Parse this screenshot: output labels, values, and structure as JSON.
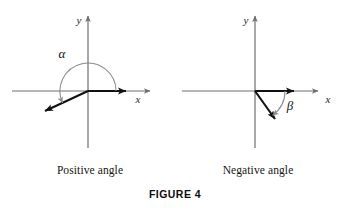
{
  "figure": {
    "label": "FIGURE 4",
    "panels": [
      {
        "id": "positive",
        "caption": "Positive angle",
        "angle_symbol": "α",
        "x_axis_label": "x",
        "y_axis_label": "y",
        "direction": "counterclockwise",
        "terminal_angle_deg": 205,
        "initial_side_angle_deg": 0,
        "arc_radius": 28
      },
      {
        "id": "negative",
        "caption": "Negative angle",
        "angle_symbol": "β",
        "x_axis_label": "x",
        "y_axis_label": "y",
        "direction": "clockwise",
        "terminal_angle_deg": -54,
        "initial_side_angle_deg": 0,
        "arc_radius": 30
      }
    ]
  },
  "colors": {
    "axis": "#6e6e6e",
    "ray": "#111111",
    "arc": "#8c8c8c",
    "text": "#141414",
    "background": "#ffffff"
  }
}
